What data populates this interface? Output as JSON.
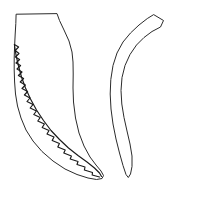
{
  "figure": {
    "background_color": "#ffffff",
    "stroke_color": "#2b2b2b",
    "detail_stroke_color": "#1a1a1a",
    "fill_color": "#ffffff",
    "width": 197,
    "height": 198,
    "title": "",
    "caption": "",
    "objects": [
      {
        "name": "serrated-blade-specimen",
        "label": "",
        "position": "left",
        "description": "elongated outline with flat horizontal top edge, flaring right side, curving to a rounded tip at lower right, and a serrated zigzag working edge along the lower left margin",
        "outline_path": "M 16.5 14.2 L 57.0 13.6 L 59.5 20.5 L 64.0 30.0 L 69.0 41.0 L 72.0 52.0 L 73.0 62.0 L 73.2 74.0 L 73.0 88.0 L 73.5 102.0 L 75.5 118.0 L 79.0 133.0 L 84.0 146.0 L 90.0 157.0 L 96.0 165.0 L 101.0 171.0 L 103.5 175.5 L 102.0 178.5 L 96.5 179.5 L 88.0 178.0 L 77.0 174.5 L 65.0 169.0 L 53.0 161.0 L 42.0 151.5 L 33.0 141.0 L 26.0 130.0 L 21.0 118.0 L 17.5 106.0 L 15.5 94.0 L 14.6 82.0 L 14.2 70.0 L 14.2 58.0 L 14.6 46.0 L 15.2 34.0 L 15.8 24.0 Z",
        "serration_path": "M 14.4 44.5 L 18.6 47.0 L 15.2 50.5 L 19.0 53.5 L 15.4 57.0 L 19.6 59.5 L 16.0 63.0 L 20.6 65.5 L 17.0 69.0 L 22.0 72.0 L 18.4 75.5 L 23.6 78.5 L 20.2 82.0 L 25.4 85.0 L 22.0 88.5 L 27.6 91.5 L 24.4 95.0 L 30.0 98.0 L 27.0 101.5 L 33.0 104.5 L 30.2 108.0 L 36.4 111.0 L 33.8 114.5 L 40.2 117.5 L 37.8 121.0 L 44.4 124.0 L 42.2 127.5 L 49.0 130.5 L 47.0 134.0 L 54.0 137.0 L 52.2 140.5 L 59.4 143.5 L 57.8 147.0 L 65.2 150.0 L 63.8 153.0 L 71.4 156.0 L 70.2 159.0 L 78.0 161.5 L 77.0 164.5 L 85.0 167.0 L 84.4 170.0 L 92.5 172.5 L 92.2 175.0 L 99.5 177.0",
        "inner_edge_path": "M 14.4 44.5 L 16.0 55.0 L 18.5 66.0 L 21.5 77.0 L 25.5 88.0 L 30.5 99.0 L 36.5 110.0 L 43.5 120.5 L 51.0 130.5 L 59.5 139.5 L 68.5 148.0 L 78.0 155.5 L 87.0 162.0 L 94.5 168.0 L 99.5 173.0 L 101.5 176.5"
      },
      {
        "name": "curved-horn-specimen",
        "label": "",
        "position": "right",
        "description": "slender crescent shaped horn or tusk outline, widest near the top with an obliquely truncated flat end at upper right, arcing left and down to a narrow pointed tip at the bottom",
        "outline_path": "M 154.0 14.8 L 163.5 20.5 L 160.5 27.0 L 152.0 31.5 L 144.0 37.5 L 136.5 45.0 L 130.0 54.5 L 125.0 65.5 L 122.0 77.5 L 121.0 90.5 L 121.8 104.0 L 124.0 117.5 L 127.0 131.0 L 130.0 144.0 L 132.0 156.0 L 132.0 166.5 L 130.5 174.0 L 128.3 177.5 L 126.0 174.5 L 123.0 165.5 L 119.5 153.0 L 116.0 139.0 L 113.0 124.0 L 111.0 109.0 L 110.2 94.0 L 110.8 79.5 L 113.0 65.5 L 117.0 53.0 L 123.0 42.0 L 130.5 33.0 L 139.0 25.0 L 147.0 18.8 Z"
      }
    ]
  }
}
